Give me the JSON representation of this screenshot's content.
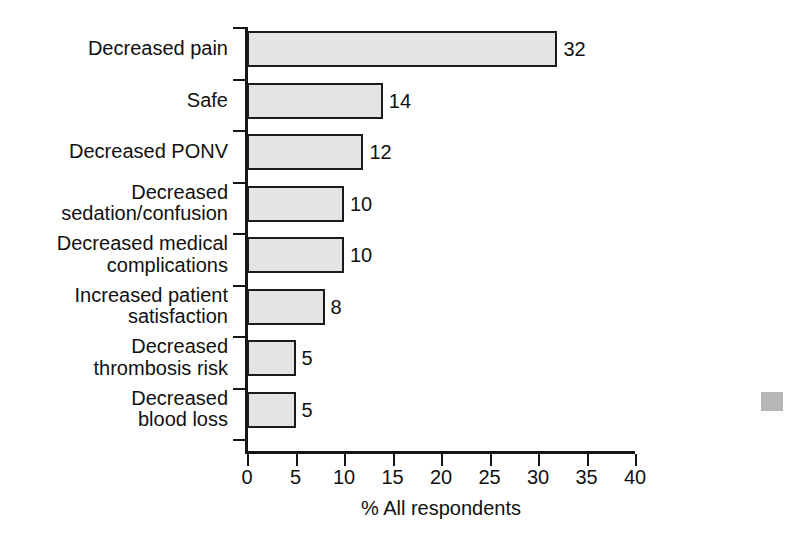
{
  "chart_data": {
    "type": "bar",
    "orientation": "horizontal",
    "title": "",
    "xlabel": "% All respondents",
    "ylabel": "",
    "xlim": [
      0,
      40
    ],
    "xticks": [
      0,
      5,
      10,
      15,
      20,
      25,
      30,
      35,
      40
    ],
    "grid": false,
    "legend": null,
    "categories": [
      "Decreased pain",
      "Safe",
      "Decreased PONV",
      "Decreased\nsedation/confusion",
      "Decreased medical\ncomplications",
      "Increased patient\nsatisfaction",
      "Decreased\nthrombosis risk",
      "Decreased\nblood loss"
    ],
    "values": [
      32,
      14,
      12,
      10,
      10,
      8,
      5,
      5
    ],
    "value_labels": [
      "32",
      "14",
      "12",
      "10",
      "10",
      "8",
      "5",
      "5"
    ],
    "bar_fill_color": "#e4e4e4",
    "bar_edge_color": "#1b1b1b",
    "axis_color": "#151515",
    "background_color": "#ffffff"
  },
  "artifact": {
    "name": "scan-artifact",
    "color": "#a9a9a9"
  }
}
